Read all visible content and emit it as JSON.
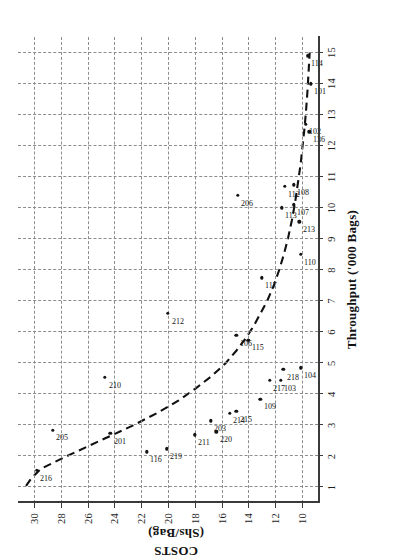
{
  "figure": {
    "title": "",
    "orientation": "rotated-90-landscape-on-portrait-page"
  },
  "axes": {
    "x_title": "Throughput  ('000 Bags)",
    "y_title_line1": "COSTS",
    "y_title_line2": "(Shs/Bag)",
    "x_ticks": [
      "1",
      "2",
      "3",
      "4",
      "5",
      "6",
      "7",
      "8",
      "9",
      "10",
      "11",
      "12",
      "13",
      "14",
      "15"
    ],
    "y_ticks": [
      "30",
      "28",
      "26",
      "24",
      "22",
      "20",
      "18",
      "16",
      "14",
      "12",
      "10"
    ]
  },
  "chart_data": {
    "type": "scatter",
    "title": "",
    "xlabel": "Throughput  ('000 Bags)",
    "ylabel": "COSTS (Shs/Bag)",
    "xlim": [
      0.5,
      15.5
    ],
    "ylim": [
      8.8,
      31.2
    ],
    "grid": true,
    "legend": "none",
    "x_ticks": [
      1,
      2,
      3,
      4,
      5,
      6,
      7,
      8,
      9,
      10,
      11,
      12,
      13,
      14,
      15
    ],
    "y_ticks": [
      30,
      28,
      26,
      24,
      22,
      20,
      18,
      16,
      14,
      12,
      10
    ],
    "point_label_field": "id",
    "points": [
      {
        "id": "216",
        "x": 1.55,
        "y": 29.8
      },
      {
        "id": "205",
        "x": 2.85,
        "y": 28.6
      },
      {
        "id": "210",
        "x": 4.55,
        "y": 24.7
      },
      {
        "id": "201",
        "x": 2.75,
        "y": 24.3
      },
      {
        "id": "116",
        "x": 2.15,
        "y": 21.6
      },
      {
        "id": "219",
        "x": 2.25,
        "y": 20.1
      },
      {
        "id": "212",
        "x": 6.6,
        "y": 20.0
      },
      {
        "id": "211",
        "x": 2.7,
        "y": 18.0
      },
      {
        "id": "203",
        "x": 3.15,
        "y": 16.8
      },
      {
        "id": "220",
        "x": 2.8,
        "y": 16.4
      },
      {
        "id": "214",
        "x": 3.4,
        "y": 15.4
      },
      {
        "id": "215",
        "x": 3.45,
        "y": 14.9
      },
      {
        "id": "106",
        "x": 5.9,
        "y": 14.9
      },
      {
        "id": "206",
        "x": 10.4,
        "y": 14.8
      },
      {
        "id": "115",
        "x": 5.75,
        "y": 14.0
      },
      {
        "id": "109",
        "x": 3.85,
        "y": 13.1
      },
      {
        "id": "117",
        "x": 7.75,
        "y": 13.0
      },
      {
        "id": "217",
        "x": 4.45,
        "y": 12.4
      },
      {
        "id": "103",
        "x": 4.45,
        "y": 11.6
      },
      {
        "id": "113",
        "x": 10.0,
        "y": 11.5
      },
      {
        "id": "112",
        "x": 10.7,
        "y": 11.3
      },
      {
        "id": "218",
        "x": 4.8,
        "y": 11.4
      },
      {
        "id": "107",
        "x": 10.1,
        "y": 10.6
      },
      {
        "id": "108",
        "x": 10.75,
        "y": 10.6
      },
      {
        "id": "104",
        "x": 4.85,
        "y": 10.1
      },
      {
        "id": "110",
        "x": 8.5,
        "y": 10.1
      },
      {
        "id": "213",
        "x": 9.55,
        "y": 10.2
      },
      {
        "id": "102",
        "x": 12.7,
        "y": 9.7
      },
      {
        "id": "136",
        "x": 12.45,
        "y": 9.45
      },
      {
        "id": "114",
        "x": 14.9,
        "y": 9.55
      },
      {
        "id": "101",
        "x": 14.0,
        "y": 9.35
      }
    ],
    "fitted_curve": {
      "style": "dashed",
      "color": "#111111",
      "description": "Decreasing convex average-cost curve fitted through the data",
      "x": [
        1.05,
        1.3,
        1.6,
        2.0,
        2.2,
        2.6,
        3.0,
        3.4,
        3.8,
        4.2,
        4.6,
        5.0,
        5.4,
        5.8,
        6.2,
        6.6,
        7.0,
        7.5,
        8.0,
        8.5,
        9.0,
        9.6,
        10.2,
        10.8,
        11.4,
        12.0,
        12.6,
        13.2,
        13.8,
        14.4,
        15.0
      ],
      "y": [
        30.6,
        30.2,
        29.5,
        27.6,
        26.6,
        24.6,
        22.6,
        20.8,
        19.2,
        17.9,
        16.7,
        15.7,
        14.9,
        14.2,
        13.6,
        13.1,
        12.6,
        12.1,
        11.7,
        11.35,
        11.05,
        10.75,
        10.5,
        10.3,
        10.1,
        9.95,
        9.8,
        9.68,
        9.58,
        9.5,
        9.42
      ]
    }
  },
  "colors": {
    "point": "#141414",
    "curve": "#111111",
    "grid": "#8d8d8d",
    "axis": "#3a3a3a",
    "background": "#ffffff"
  }
}
